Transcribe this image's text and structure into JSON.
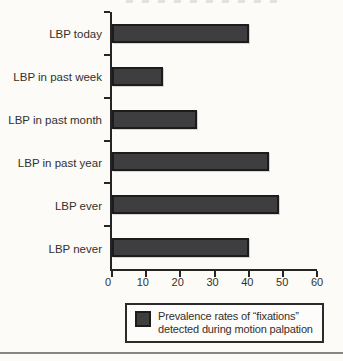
{
  "page": {
    "background": "#fcfbf8"
  },
  "chart_data": {
    "type": "bar",
    "orientation": "horizontal",
    "title": "",
    "categories": [
      "LBP today",
      "LBP in past week",
      "LBP in past month",
      "LBP in past year",
      "LBP ever",
      "LBP never"
    ],
    "values": [
      40,
      15,
      25,
      46,
      49,
      40
    ],
    "xlim": [
      0,
      60
    ],
    "x_ticks": [
      "0",
      "10",
      "20",
      "30",
      "40",
      "50",
      "60"
    ],
    "grid": false,
    "bar_color": "#3e3e40",
    "bar_border_color": "#1c1c1c",
    "axis_color": "#252525",
    "legend": {
      "position": "bottom",
      "swatch_color": "#3e3e40",
      "line1": "Prevalence rates of “fixations”",
      "line2": "detected during motion palpation"
    }
  },
  "footer": {
    "rule_color": "#858585"
  }
}
